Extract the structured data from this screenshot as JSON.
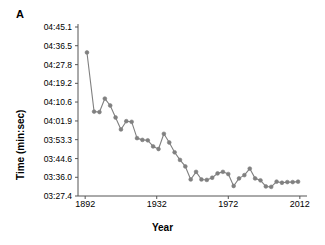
{
  "panel": {
    "label": "A"
  },
  "chart_data": {
    "type": "line",
    "title": "",
    "xlabel": "Year",
    "ylabel": "Time (min:sec)",
    "xlim": [
      1888,
      2016
    ],
    "ylim": [
      207.4,
      285.1
    ],
    "grid": false,
    "legend": null,
    "series_color": "#808080",
    "marker": "circle",
    "xticks": [
      1892,
      1932,
      1972,
      2012
    ],
    "xticklabels": [
      "1892",
      "1932",
      "1972",
      "2012"
    ],
    "yticks": [
      207.4,
      216.0,
      224.6,
      233.3,
      241.9,
      250.6,
      259.2,
      267.8,
      276.5,
      285.1
    ],
    "yticklabels": [
      "03:27.4",
      "03:36.0",
      "03:44.6",
      "03:53.3",
      "04:01.9",
      "04:10.6",
      "04:19.2",
      "04:27.8",
      "04:36.5",
      "04:45.1"
    ],
    "x": [
      1893,
      1897,
      1900,
      1903,
      1906,
      1909,
      1912,
      1915,
      1918,
      1921,
      1924,
      1927,
      1930,
      1933,
      1936,
      1939,
      1942,
      1945,
      1948,
      1951,
      1954,
      1957,
      1960,
      1963,
      1966,
      1969,
      1972,
      1975,
      1978,
      1981,
      1984,
      1987,
      1990,
      1993,
      1996,
      1999,
      2002,
      2005,
      2008,
      2011
    ],
    "values": [
      273.4,
      246.2,
      246.0,
      252.2,
      249.0,
      243.5,
      238.0,
      241.8,
      241.5,
      234.0,
      233.2,
      233.0,
      230.2,
      229.0,
      236.0,
      232.0,
      227.5,
      224.0,
      221.0,
      215.0,
      218.5,
      215.0,
      214.8,
      215.8,
      217.8,
      218.5,
      217.5,
      212.0,
      215.5,
      217.0,
      220.0,
      215.5,
      214.6,
      211.8,
      211.6,
      214.0,
      213.5,
      213.8,
      213.8,
      214.0
    ],
    "values_formatted": [
      "04:33.4",
      "04:06.2",
      "04:06.0",
      "04:12.2",
      "04:09.0",
      "04:03.5",
      "03:58.0",
      "04:01.8",
      "04:01.5",
      "03:54.0",
      "03:53.2",
      "03:53.0",
      "03:50.2",
      "03:49.0",
      "03:56.0",
      "03:52.0",
      "03:47.5",
      "03:44.0",
      "03:41.0",
      "03:35.0",
      "03:38.5",
      "03:35.0",
      "03:34.8",
      "03:35.8",
      "03:37.8",
      "03:38.5",
      "03:37.5",
      "03:32.0",
      "03:35.5",
      "03:37.0",
      "03:40.0",
      "03:35.5",
      "03:34.6",
      "03:31.8",
      "03:31.6",
      "03:34.0",
      "03:33.5",
      "03:33.8",
      "03:33.8",
      "03:34.0"
    ]
  }
}
